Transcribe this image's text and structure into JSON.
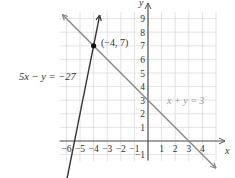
{
  "chart_data": {
    "type": "line",
    "title": "",
    "xlabel": "x",
    "ylabel": "y",
    "xlim": [
      -6.5,
      5
    ],
    "ylim": [
      -1.5,
      9.5
    ],
    "grid": true,
    "x_ticks": [
      -6,
      -5,
      -4,
      -3,
      -2,
      -1,
      1,
      2,
      3,
      4
    ],
    "y_ticks": [
      -1,
      1,
      2,
      3,
      4,
      5,
      6,
      7,
      8,
      9
    ],
    "series": [
      {
        "name": "5x − y = −27",
        "equation": "y = 5x + 27",
        "color": "#333333",
        "points": [
          [
            -6.3,
            -4.5
          ],
          [
            -3.55,
            9.25
          ]
        ]
      },
      {
        "name": "x + y = 3",
        "equation": "y = 3 − x",
        "color": "#888888",
        "points": [
          [
            -6.3,
            9.3
          ],
          [
            5,
            -2
          ]
        ]
      }
    ],
    "annotations": [
      {
        "text": "(−4, 7)",
        "x": -4,
        "y": 7,
        "marker": "point"
      },
      {
        "text": "5x − y = −27",
        "ref": "series.0"
      },
      {
        "text": "x + y = 3",
        "ref": "series.1"
      }
    ]
  },
  "labels": {
    "x_axis": "x",
    "y_axis": "y",
    "point": "(−4, 7)",
    "eq1": "5x − y = −27",
    "eq2": "x + y = 3"
  }
}
